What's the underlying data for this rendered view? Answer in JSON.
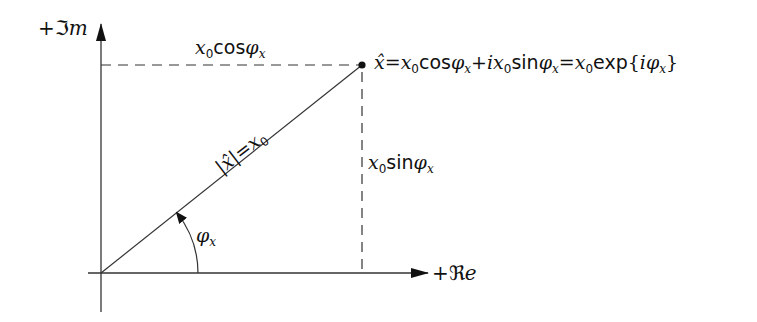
{
  "diagram": {
    "type": "complex-plane-phasor",
    "colors": {
      "line": "#333333",
      "text": "#111111",
      "background": "#ffffff"
    },
    "axes": {
      "imag_label": {
        "sign": "+",
        "symbol": "ℑ",
        "suffix": "m"
      },
      "real_label": {
        "sign": "+",
        "symbol": "ℜ",
        "suffix": "e"
      }
    },
    "labels": {
      "horizontal_projection": {
        "var": "x",
        "sub": "0",
        "fn": "cos",
        "angle": "φ",
        "angle_sub": "x"
      },
      "vertical_projection": {
        "var": "x",
        "sub": "0",
        "fn": "sin",
        "angle": "φ",
        "angle_sub": "x"
      },
      "magnitude": {
        "lhs": "|x̂|",
        "eq": "=",
        "var": "x",
        "sub": "0"
      },
      "angle": {
        "angle": "φ",
        "angle_sub": "x"
      },
      "point_equation": {
        "lhs": "x̂",
        "eq1": "=",
        "t1_var": "x",
        "t1_sub": "0",
        "t1_fn": "cos",
        "t1_angle": "φ",
        "t1_angle_sub": "x",
        "plus": "+",
        "i": "i",
        "t2_var": "x",
        "t2_sub": "0",
        "t2_fn": "sin",
        "t2_angle": "φ",
        "t2_angle_sub": "x",
        "eq2": "=",
        "t3_var": "x",
        "t3_sub": "0",
        "t3_fn": "exp",
        "open": "{",
        "t3_i": "i",
        "t3_angle": "φ",
        "t3_angle_sub": "x",
        "close": "}"
      }
    },
    "geometry": {
      "origin": [
        101,
        273
      ],
      "point": [
        362,
        65
      ],
      "y_axis_top": [
        101,
        22
      ],
      "y_axis_bottom": [
        101,
        312
      ],
      "x_axis_left": [
        88,
        273
      ],
      "x_axis_right": [
        428,
        273
      ]
    }
  }
}
